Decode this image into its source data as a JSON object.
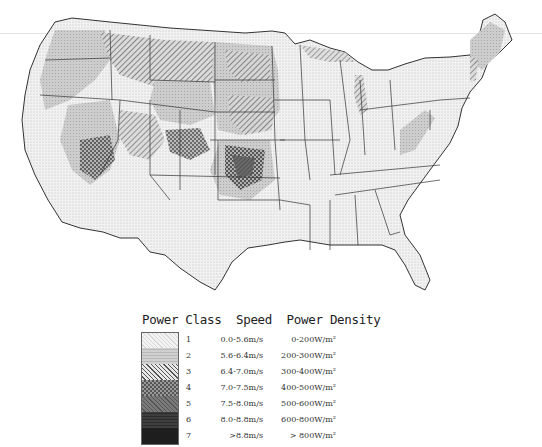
{
  "map": {
    "subject": "Wind power class map of the contiguous United States",
    "regions_shading": {
      "southeast": "class 1",
      "great_plains": "class 3-4",
      "southern_plains_center": "class 5",
      "mountain_west": "mixed class 2-6"
    }
  },
  "legend": {
    "header": {
      "col1": "Power Class",
      "col2": "Speed",
      "col3": "Power Density"
    },
    "rows": [
      {
        "cls": "1",
        "speed": "0.0-5.6m/s",
        "density": "0-200W/m²",
        "color": "#f0f0f0"
      },
      {
        "cls": "2",
        "speed": "5.6-6.4m/s",
        "density": "200-300W/m²",
        "color": "#cfcfcf"
      },
      {
        "cls": "3",
        "speed": "6.4-7.0m/s",
        "density": "300-400W/m²",
        "color": "#b8b8b8"
      },
      {
        "cls": "4",
        "speed": "7.0-7.5m/s",
        "density": "400-500W/m²",
        "color": "#8c8c8c"
      },
      {
        "cls": "5",
        "speed": "7.5-8.0m/s",
        "density": "500-600W/m²",
        "color": "#6a6a6a"
      },
      {
        "cls": "6",
        "speed": "8.0-8.8m/s",
        "density": "600-800W/m²",
        "color": "#3c3c3c"
      },
      {
        "cls": "7",
        "speed": ">8.8m/s",
        "density": "> 800W/m²",
        "color": "#1e1e1e"
      }
    ]
  }
}
